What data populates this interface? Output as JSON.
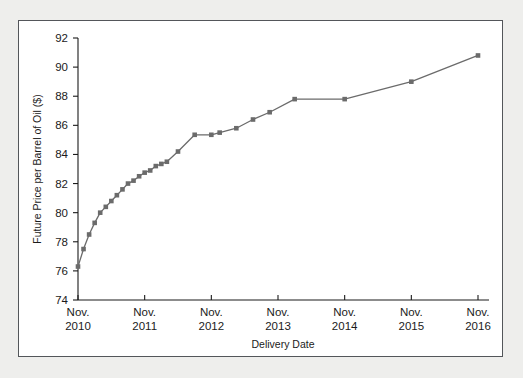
{
  "figure": {
    "background_color": "#eeeeec",
    "panel_color": "#ffffff",
    "frame_color": "#53565a",
    "series_color": "#6b6b6b",
    "axis_color": "#1b1b1b"
  },
  "chart_data": {
    "type": "line",
    "title": "",
    "subtitle": "",
    "xlabel": "Delivery Date",
    "ylabel": "Future Price per Barrel of Oil ($)",
    "xlim": [
      2010.0,
      2016.0
    ],
    "ylim": [
      74,
      92
    ],
    "grid": false,
    "legend": null,
    "marker": "square",
    "x_tick_labels": [
      "Nov.\n2010",
      "Nov.\n2011",
      "Nov.\n2012",
      "Nov.\n2013",
      "Nov.\n2014",
      "Nov.\n2015",
      "Nov.\n2016"
    ],
    "x_ticks_line1": [
      "Nov.",
      "Nov.",
      "Nov.",
      "Nov.",
      "Nov.",
      "Nov.",
      "Nov."
    ],
    "x_ticks_line2": [
      "2010",
      "2011",
      "2012",
      "2013",
      "2014",
      "2015",
      "2016"
    ],
    "x_tick_values": [
      2010.0,
      2011.0,
      2012.0,
      2013.0,
      2014.0,
      2015.0,
      2016.0
    ],
    "y_tick_labels": [
      "74",
      "76",
      "78",
      "80",
      "82",
      "84",
      "86",
      "88",
      "90",
      "92"
    ],
    "y_tick_values": [
      74,
      76,
      78,
      80,
      82,
      84,
      86,
      88,
      90,
      92
    ],
    "series": [
      {
        "name": "Oil futures price",
        "x": [
          2010.0,
          2010.083,
          2010.167,
          2010.25,
          2010.333,
          2010.417,
          2010.5,
          2010.583,
          2010.667,
          2010.75,
          2010.833,
          2010.917,
          2011.0,
          2011.083,
          2011.167,
          2011.25,
          2011.333,
          2011.5,
          2011.75,
          2012.0,
          2012.125,
          2012.375,
          2012.625,
          2012.875,
          2013.25,
          2014.0,
          2015.0,
          2016.0
        ],
        "y": [
          76.3,
          77.5,
          78.5,
          79.3,
          80.0,
          80.4,
          80.8,
          81.2,
          81.6,
          82.0,
          82.2,
          82.5,
          82.75,
          82.9,
          83.2,
          83.35,
          83.5,
          84.2,
          85.35,
          85.35,
          85.5,
          85.8,
          86.4,
          86.9,
          87.8,
          87.8,
          89.0,
          90.8
        ]
      }
    ]
  },
  "axes": {
    "y_axis_title": "Future Price per Barrel of Oil ($)",
    "x_axis_title": "Delivery Date"
  }
}
